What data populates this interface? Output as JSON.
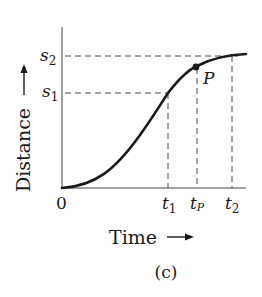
{
  "figure": {
    "caption": "(c)",
    "x_axis_label": "Time",
    "y_axis_label": "Distance",
    "origin_label": "0",
    "y_ticks": [
      {
        "label": "s",
        "sub": "2"
      },
      {
        "label": "s",
        "sub": "1"
      }
    ],
    "x_ticks": [
      {
        "label": "t",
        "sub": "1"
      },
      {
        "label": "t",
        "sub": "P"
      },
      {
        "label": "t",
        "sub": "2"
      }
    ],
    "point_label": "P",
    "colors": {
      "ink": "#1a1a1a",
      "background": "#ffffff"
    }
  }
}
